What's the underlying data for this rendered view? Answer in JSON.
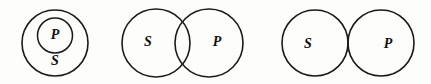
{
  "figure": {
    "background_color": "#fdfdfc",
    "stroke_color": "#1a1a1a",
    "label_color": "#111111",
    "canvas": {
      "width": 431,
      "height": 84
    }
  },
  "diagrams": [
    {
      "id": "diagram-1",
      "name": "p-inside-s",
      "relation": "containment",
      "description": "Smaller circle P fully inside larger circle S",
      "circles": [
        {
          "label": "S",
          "cx": 55,
          "cy": 43,
          "r": 33,
          "role": "outer",
          "label_x": 55,
          "label_y": 62,
          "font_size": 14
        },
        {
          "label": "P",
          "cx": 55,
          "cy": 35.5,
          "r": 17.5,
          "role": "inner",
          "label_x": 55,
          "label_y": 35.5,
          "font_size": 14
        }
      ]
    },
    {
      "id": "diagram-2",
      "name": "s-overlaps-p",
      "relation": "partial-overlap",
      "description": "Circles S and P intersect in a lens-shaped region",
      "circles": [
        {
          "label": "S",
          "cx": 156,
          "cy": 43,
          "r": 34,
          "role": "left",
          "label_x": 148,
          "label_y": 43,
          "font_size": 14
        },
        {
          "label": "P",
          "cx": 209,
          "cy": 43,
          "r": 34,
          "role": "right",
          "label_x": 217,
          "label_y": 43,
          "font_size": 14
        }
      ]
    },
    {
      "id": "diagram-3",
      "name": "s-tangent-p",
      "relation": "exclusion-tangent",
      "description": "Circles S and P touch externally at a single point",
      "circles": [
        {
          "label": "S",
          "cx": 315,
          "cy": 43,
          "r": 33,
          "role": "left",
          "label_x": 308,
          "label_y": 45,
          "font_size": 14
        },
        {
          "label": "P",
          "cx": 381,
          "cy": 43,
          "r": 33,
          "role": "right",
          "label_x": 388,
          "label_y": 45,
          "font_size": 14
        }
      ]
    }
  ]
}
